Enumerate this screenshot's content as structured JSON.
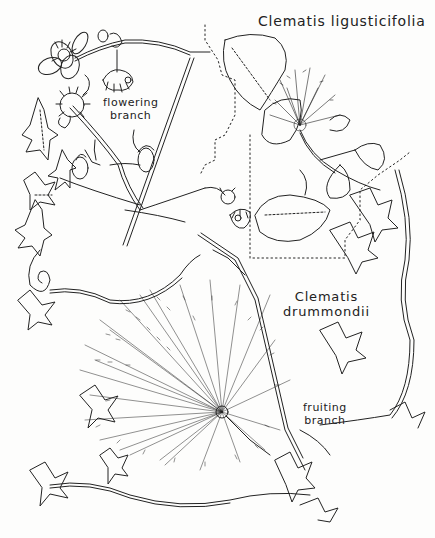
{
  "plate": {
    "species": [
      {
        "name": "Clematis ligusticifolia"
      },
      {
        "name_line1": "Clematis",
        "name_line2": "drummondii"
      }
    ],
    "labels": {
      "flowering": {
        "line1": "flowering",
        "line2": "branch"
      },
      "fruiting": {
        "line1": "fruiting",
        "line2": "branch"
      }
    },
    "colors": {
      "ink": "#222222",
      "paper": "#fdfdfc"
    }
  }
}
